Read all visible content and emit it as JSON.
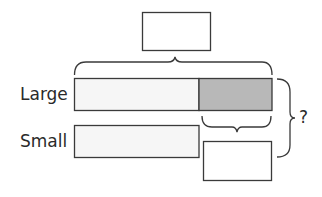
{
  "diagram": {
    "type": "bar-model",
    "rows": [
      {
        "label": "Large",
        "segments": [
          {
            "role": "equal-part",
            "fill": "#f6f6f6"
          },
          {
            "role": "extra-part",
            "fill": "#b8b8b8"
          }
        ]
      },
      {
        "label": "Small",
        "segments": [
          {
            "role": "equal-part",
            "fill": "#f6f6f6"
          }
        ]
      }
    ],
    "top_box": {
      "value": ""
    },
    "difference_box": {
      "value": ""
    },
    "question_mark": "?",
    "colors": {
      "stroke": "#3a3a3a",
      "light_fill": "#f6f6f6",
      "shaded_fill": "#b8b8b8"
    }
  }
}
